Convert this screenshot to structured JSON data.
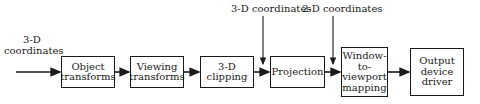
{
  "diagram": {
    "input_label": "3-D coordinates",
    "input_label_line1": "3-D",
    "input_label_line2": "coordinates",
    "top_labels": [
      {
        "text": "3-D coordinates"
      },
      {
        "text": "2-D coordinates"
      }
    ],
    "stages": [
      {
        "id": "object-transforms",
        "label": "Object transforms"
      },
      {
        "id": "viewing-transforms",
        "label": "Viewing transforms"
      },
      {
        "id": "3d-clipping",
        "label": "3-D clipping"
      },
      {
        "id": "projection",
        "label": "Projection"
      },
      {
        "id": "window-to-viewport-mapping",
        "label": "Window-to-viewport mapping"
      },
      {
        "id": "output-device-driver",
        "label": "Output device driver"
      }
    ],
    "stage_lines": {
      "s0": [
        "Object",
        "transforms"
      ],
      "s1": [
        "Viewing",
        "transforms"
      ],
      "s2": [
        "3-D",
        "clipping"
      ],
      "s3": [
        "Projection"
      ],
      "s4": [
        "Window-",
        "to-",
        "viewport",
        "mapping"
      ],
      "s5": [
        "Output",
        "device",
        "driver"
      ]
    },
    "line_color": "#1a1a1a"
  }
}
